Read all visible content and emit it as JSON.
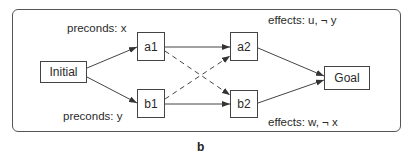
{
  "diagram": {
    "caption": "b",
    "nodes": {
      "initial": "Initial",
      "a1": "a1",
      "b1": "b1",
      "a2": "a2",
      "b2": "b2",
      "goal": "Goal"
    },
    "annotations": {
      "a1_preconds": "preconds:  x",
      "b1_preconds": "preconds:  y",
      "a2_effects": "effects:   u, ¬ y",
      "b2_effects": "effects:   w, ¬ x"
    },
    "edges": [
      {
        "from": "Initial",
        "to": "a1",
        "style": "solid"
      },
      {
        "from": "Initial",
        "to": "b1",
        "style": "solid"
      },
      {
        "from": "a1",
        "to": "a2",
        "style": "solid"
      },
      {
        "from": "b1",
        "to": "b2",
        "style": "solid"
      },
      {
        "from": "a1",
        "to": "b2",
        "style": "dashed"
      },
      {
        "from": "b1",
        "to": "a2",
        "style": "dashed"
      },
      {
        "from": "a2",
        "to": "Goal",
        "style": "solid"
      },
      {
        "from": "b2",
        "to": "Goal",
        "style": "solid"
      }
    ]
  }
}
